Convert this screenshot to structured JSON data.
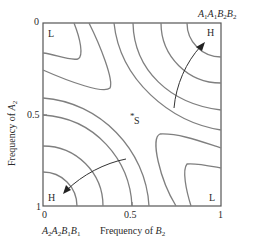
{
  "diagram": {
    "type": "adaptive-landscape-contour",
    "frame": {
      "left": 43,
      "top": 23,
      "right": 221,
      "bottom": 206
    },
    "line_color": "#7a7a7a",
    "axis_color": "#555555",
    "x_axis": {
      "label_prefix": "Frequency of ",
      "label_var": "B",
      "label_sub": "2",
      "ticks": [
        "0",
        "0.5",
        "1"
      ]
    },
    "y_axis": {
      "label_prefix": "Frequency of ",
      "label_var": "A",
      "label_sub": "2",
      "ticks": [
        "0",
        "0.5",
        "1"
      ]
    },
    "corners": {
      "top_left": "L",
      "top_right": "H",
      "bottom_left": "H",
      "bottom_right": "L"
    },
    "genotype_top_right": {
      "g1": "A",
      "s1": "1",
      "g2": "A",
      "s2": "1",
      "g3": "B",
      "s3": "2",
      "g4": "B",
      "s4": "2"
    },
    "genotype_bottom_left": {
      "g1": "A",
      "s1": "2",
      "g2": "A",
      "s2": "2",
      "g3": "B",
      "s3": "1",
      "g4": "B",
      "s4": "1"
    },
    "saddle_label": "S",
    "saddle_marker": "*"
  }
}
